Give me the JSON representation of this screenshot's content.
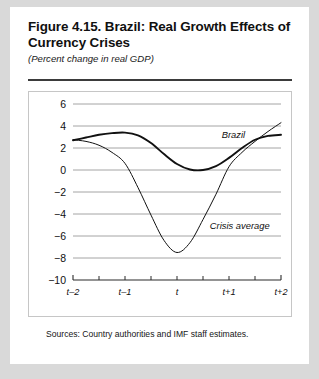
{
  "figure": {
    "title": "Figure 4.15. Brazil: Real Growth Effects of Currency Crises",
    "subtitle": "(Percent change in real GDP)",
    "source_note": "Sources: Country authorities and IMF staff estimates."
  },
  "chart_data": {
    "type": "line",
    "title": "Figure 4.15. Brazil: Real Growth Effects of Currency Crises",
    "subtitle": "(Percent change in real GDP)",
    "xlabel": "",
    "ylabel": "",
    "ylim": [
      -10,
      6
    ],
    "yticks": [
      6,
      4,
      2,
      0,
      -2,
      -4,
      -6,
      -8,
      -10
    ],
    "ytick_labels": [
      "6",
      "4",
      "2",
      "0",
      "−2",
      "−4",
      "−6",
      "−8",
      "−10"
    ],
    "xlim": [
      -2,
      2
    ],
    "xticks": [
      -2,
      -1,
      0,
      1,
      2
    ],
    "xtick_labels": [
      "t–2",
      "t–1",
      "t",
      "t+1",
      "t+2"
    ],
    "grid": "horizontal",
    "legend_position": "inline-annotations",
    "series": [
      {
        "name": "Brazil",
        "label_x": 0.86,
        "label_y": 2.9,
        "line_width": 1.9,
        "x": [
          -2.0,
          -1.75,
          -1.5,
          -1.25,
          -1.0,
          -0.75,
          -0.5,
          -0.25,
          0.0,
          0.25,
          0.5,
          0.75,
          1.0,
          1.25,
          1.5,
          1.75,
          2.0
        ],
        "values": [
          2.7,
          2.95,
          3.2,
          3.35,
          3.4,
          3.15,
          2.45,
          1.45,
          0.55,
          0.05,
          0.0,
          0.35,
          1.1,
          2.0,
          2.75,
          3.1,
          3.2
        ]
      },
      {
        "name": "Crisis average",
        "label_x": 0.63,
        "label_y": -5.35,
        "line_width": 1.0,
        "x": [
          -2.0,
          -1.75,
          -1.5,
          -1.25,
          -1.0,
          -0.75,
          -0.5,
          -0.25,
          0.0,
          0.25,
          0.5,
          0.75,
          1.0,
          1.25,
          1.5,
          1.75,
          2.0
        ],
        "values": [
          2.75,
          2.6,
          2.25,
          1.6,
          0.6,
          -1.6,
          -4.1,
          -6.4,
          -7.5,
          -6.6,
          -4.5,
          -2.2,
          0.3,
          1.6,
          2.6,
          3.5,
          4.3
        ]
      }
    ]
  }
}
